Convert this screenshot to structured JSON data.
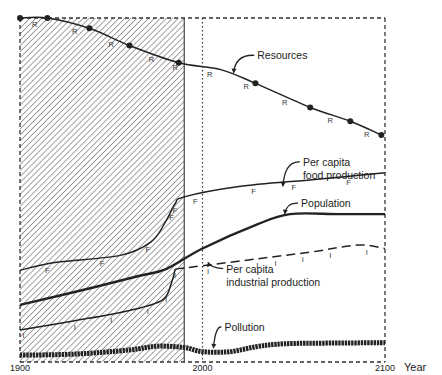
{
  "chart_data": {
    "type": "line",
    "title": "",
    "xlabel": "Year",
    "ylabel": "",
    "xlim": [
      1900,
      2100
    ],
    "ylim": [
      0,
      100
    ],
    "x_ticks": [
      {
        "value": 1900,
        "label": "1900"
      },
      {
        "value": 2000,
        "label": "2000"
      },
      {
        "value": 2100,
        "label": "2100"
      }
    ],
    "historical_shading": {
      "from": 1900,
      "to": 1990,
      "pattern": "diagonal-hatch"
    },
    "reference_line": {
      "year": 2000,
      "style": "dotted"
    },
    "grid": false,
    "series": [
      {
        "name": "Resources",
        "label_lines": [
          "Resources"
        ],
        "marker_letter": "R",
        "style": "solid-with-dots",
        "points": [
          [
            1900,
            100
          ],
          [
            1915,
            100
          ],
          [
            1938,
            97
          ],
          [
            1960,
            92
          ],
          [
            1987,
            87
          ],
          [
            2010,
            85
          ],
          [
            2029,
            81
          ],
          [
            2059,
            74
          ],
          [
            2081,
            70
          ],
          [
            2098,
            66
          ]
        ],
        "dot_years": [
          1900,
          1915,
          1938,
          1960,
          1987,
          2029,
          2059,
          2081,
          2098
        ],
        "letter_years": [
          1908,
          1930,
          1950,
          1972,
          1985,
          2004,
          2024,
          2045,
          2070,
          2090
        ]
      },
      {
        "name": "Per capita food production",
        "label_lines": [
          "Per capita",
          "food production"
        ],
        "marker_letter": "F",
        "style": "solid",
        "points": [
          [
            1900,
            26.7
          ],
          [
            1920,
            29
          ],
          [
            1955,
            31
          ],
          [
            1972,
            35
          ],
          [
            1980,
            41
          ],
          [
            1985,
            46
          ],
          [
            1990,
            48
          ],
          [
            2020,
            51
          ],
          [
            2060,
            53
          ],
          [
            2100,
            55
          ]
        ],
        "letter_years": [
          1915,
          1945,
          1970,
          1983,
          1985,
          1996,
          2028,
          2050,
          2080
        ]
      },
      {
        "name": "Population",
        "label_lines": [
          "Population"
        ],
        "marker_letter": "",
        "style": "solid-bold",
        "points": [
          [
            1900,
            16.6
          ],
          [
            1935,
            21
          ],
          [
            1965,
            25
          ],
          [
            1980,
            27
          ],
          [
            2000,
            33
          ],
          [
            2030,
            40
          ],
          [
            2048,
            43
          ],
          [
            2075,
            43
          ],
          [
            2100,
            43
          ]
        ]
      },
      {
        "name": "Per capita industrial production",
        "label_lines": [
          "Per capita",
          "industrial production"
        ],
        "marker_letter": "I",
        "style": "solid-then-dashed",
        "points": [
          [
            1900,
            9.3
          ],
          [
            1930,
            12
          ],
          [
            1960,
            15
          ],
          [
            1978,
            18
          ],
          [
            1983,
            23
          ],
          [
            1985,
            27
          ],
          [
            2000,
            28
          ],
          [
            2030,
            30
          ],
          [
            2060,
            32
          ],
          [
            2085,
            34
          ],
          [
            2100,
            33
          ]
        ],
        "dash_from_year": 1985,
        "letter_years": [
          1902,
          1930,
          1950,
          1970,
          1980,
          1985,
          2003,
          2030,
          2040,
          2055,
          2070,
          2090
        ]
      },
      {
        "name": "Pollution",
        "label_lines": [
          "Pollution"
        ],
        "marker_letter": "",
        "style": "thick-beaded",
        "points": [
          [
            1900,
            2
          ],
          [
            1930,
            2.3
          ],
          [
            1960,
            3.5
          ],
          [
            1975,
            4.6
          ],
          [
            1990,
            4.2
          ],
          [
            2000,
            3
          ],
          [
            2015,
            3
          ],
          [
            2030,
            4.5
          ],
          [
            2045,
            5.3
          ],
          [
            2070,
            5.5
          ],
          [
            2100,
            5.6
          ]
        ]
      }
    ],
    "annotations": [
      {
        "text": "Resources",
        "x": 2030,
        "y": 88,
        "arrow_to": [
          2017,
          84
        ]
      },
      {
        "text": "Per capita\nfood production",
        "x": 2055,
        "y": 57,
        "arrow_to": [
          2044,
          51
        ]
      },
      {
        "text": "Population",
        "x": 2054,
        "y": 45,
        "arrow_to": [
          2045,
          43
        ]
      },
      {
        "text": "Per capita\nindustrial production",
        "x": 2013,
        "y": 26,
        "arrow_to": [
          2003,
          29
        ]
      },
      {
        "text": "Pollution",
        "x": 2012,
        "y": 9,
        "arrow_to": [
          2006,
          4
        ]
      }
    ]
  }
}
